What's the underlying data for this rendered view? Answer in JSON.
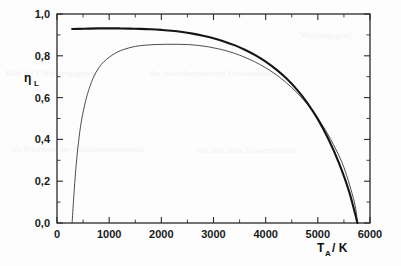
{
  "figure": {
    "background_color": "#fdfdfd",
    "scan_artifacts": [
      {
        "text": "Bild 4.11  Wirkungsgrade",
        "x": 6,
        "y": 74
      },
      {
        "text": "der  solarthermischen  Umwandlung",
        "x": 150,
        "y": 74
      },
      {
        "text": "als  Funktion  der  Absorbertemperatur",
        "x": 12,
        "y": 150
      },
      {
        "text": "mit  und  ohne  Konzentration",
        "x": 196,
        "y": 151
      },
      {
        "text": "Wirkungsgrad",
        "x": 300,
        "y": 36
      }
    ]
  },
  "chart_data": {
    "type": "line",
    "title": "",
    "subtitle": "",
    "xlabel": "T_A / K",
    "xlabel_base": "T",
    "xlabel_sub": "A",
    "xlabel_unit": "/ K",
    "ylabel": "η_L",
    "ylabel_base": "η",
    "ylabel_sub": "L",
    "xlim": [
      0,
      6000
    ],
    "ylim": [
      0.0,
      1.0
    ],
    "xticks": [
      0,
      1000,
      2000,
      3000,
      4000,
      5000,
      6000
    ],
    "xticklabels": [
      "0",
      "1000",
      "2000",
      "3000",
      "4000",
      "5000",
      "6000"
    ],
    "yticks": [
      0.0,
      0.2,
      0.4,
      0.6,
      0.8,
      1.0
    ],
    "yticklabels": [
      "0,0",
      "0,2",
      "0,4",
      "0,6",
      "0,8",
      "1,0"
    ],
    "xminor_step": 500,
    "yminor_step": 0.1,
    "grid": false,
    "legend": false,
    "legend_position": "none",
    "decimal_separator": ",",
    "series": [
      {
        "name": "upper-curve",
        "style": "thick",
        "color": "#141414",
        "linewidth": 2.1,
        "x": [
          290,
          400,
          600,
          800,
          1000,
          1200,
          1400,
          1600,
          1800,
          2000,
          2200,
          2400,
          2600,
          2800,
          3000,
          3200,
          3400,
          3600,
          3800,
          4000,
          4200,
          4400,
          4600,
          4800,
          5000,
          5200,
          5400,
          5600,
          5760
        ],
        "y": [
          0.928,
          0.929,
          0.93,
          0.931,
          0.931,
          0.931,
          0.93,
          0.929,
          0.927,
          0.924,
          0.92,
          0.914,
          0.906,
          0.896,
          0.884,
          0.869,
          0.851,
          0.829,
          0.803,
          0.772,
          0.735,
          0.691,
          0.638,
          0.574,
          0.497,
          0.403,
          0.29,
          0.15,
          0.0
        ]
      },
      {
        "name": "lower-curve",
        "style": "thin",
        "color": "#3a3a3a",
        "linewidth": 0.9,
        "x": [
          290,
          320,
          360,
          400,
          450,
          500,
          560,
          620,
          700,
          800,
          900,
          1000,
          1150,
          1300,
          1500,
          1700,
          1900,
          2100,
          2300,
          2500,
          2700,
          2900,
          3100,
          3300,
          3500,
          3700,
          3900,
          4100,
          4300,
          4500,
          4700,
          4900,
          5100,
          5300,
          5500,
          5700,
          5760
        ],
        "y": [
          0.0,
          0.12,
          0.255,
          0.36,
          0.46,
          0.53,
          0.595,
          0.645,
          0.698,
          0.742,
          0.772,
          0.793,
          0.817,
          0.832,
          0.845,
          0.851,
          0.854,
          0.855,
          0.855,
          0.854,
          0.85,
          0.843,
          0.833,
          0.82,
          0.803,
          0.782,
          0.757,
          0.727,
          0.691,
          0.648,
          0.597,
          0.536,
          0.463,
          0.375,
          0.266,
          0.1,
          0.0
        ]
      }
    ],
    "annotations": []
  }
}
